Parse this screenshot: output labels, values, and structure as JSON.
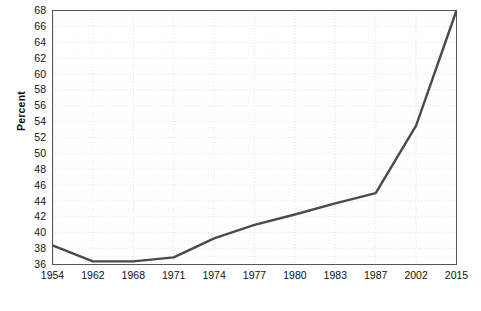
{
  "chart_data": {
    "type": "line",
    "title": "",
    "xlabel": "Year",
    "ylabel": "Percent",
    "categories": [
      "1954",
      "1962",
      "1968",
      "1971",
      "1974",
      "1977",
      "1980",
      "1983",
      "1987",
      "2002",
      "2015"
    ],
    "values": [
      38.4,
      36.4,
      36.4,
      36.9,
      39.3,
      41.0,
      42.3,
      43.7,
      45.0,
      53.5,
      68.0
    ],
    "ylim": [
      36,
      68
    ],
    "ytick_step": 2,
    "yticks": [
      36,
      38,
      40,
      42,
      44,
      46,
      48,
      50,
      52,
      54,
      56,
      58,
      60,
      62,
      64,
      66,
      68
    ],
    "yminor_step": 1,
    "grid": true,
    "grid_style": "dotted",
    "legend": "none",
    "series": [
      {
        "name": "Percent",
        "color": "#4a4a4a",
        "values": [
          38.4,
          36.4,
          36.4,
          36.9,
          39.3,
          41.0,
          42.3,
          43.7,
          45.0,
          53.5,
          68.0
        ]
      }
    ],
    "note": "2002 value is the interpolated vertex of the straight segment drawn between 1987 and 2015"
  },
  "axis": {
    "y_title": "Percent",
    "x_title": "Year"
  },
  "colors": {
    "line": "#4a4a4a",
    "axis": "#555555",
    "grid": "#cccccc",
    "background": "#ffffff",
    "text": "#111111"
  }
}
